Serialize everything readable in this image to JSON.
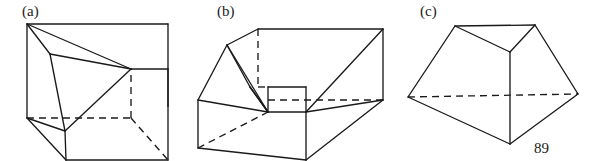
{
  "document": {
    "kind": "textbook-figure-plate",
    "page_number": "89",
    "background_color": "#ffffff",
    "ink_color": "#1a1a1a"
  },
  "figures": [
    {
      "id": "figure-a",
      "label": "(a)",
      "label_position": {
        "x": 22,
        "y": 16
      },
      "description": "cube in oblique projection with an inscribed triangular (tetrahedral) cut",
      "solid_edges": [
        "M27,24 L27,118",
        "M27,24 L131,69",
        "M27,24 L168,24",
        "M168,24 L168,106",
        "M131,69 L168,69",
        "M168,69 L168,106",
        "M27,118 L66,160",
        "M66,160 L168,160",
        "M168,160 L168,106",
        "M27,24 L50,54",
        "M50,54 L131,69",
        "M50,54 L65,131",
        "M65,131 L131,69",
        "M65,131 L66,160",
        "M27,118 L65,131"
      ],
      "hidden_edges": [
        "M27,118 L131,118",
        "M131,118 L131,69",
        "M131,118 L168,160"
      ]
    },
    {
      "id": "figure-b",
      "label": "(b)",
      "label_position": {
        "x": 217,
        "y": 16
      },
      "description": "rectangular box with a sloping wedge cut at the left-hand end",
      "solid_edges": [
        "M258,29 L383,29",
        "M383,29 L383,100",
        "M258,29 L227,45",
        "M227,45 L198,100",
        "M198,100 L198,148",
        "M198,148 L306,160",
        "M306,160 L306,112",
        "M306,112 L383,100",
        "M306,160 L383,100",
        "M227,45 L250,87",
        "M250,87 L268,112",
        "M268,112 L306,112",
        "M268,112 L250,87",
        "M227,45 L268,112",
        "M198,100 L268,112",
        "M306,112 L383,29",
        "M268,112 L268,87",
        "M268,87 L306,87",
        "M306,87 L306,112"
      ],
      "hidden_edges": [
        "M258,29 L258,87",
        "M258,87 L268,87",
        "M268,100 L383,100",
        "M198,148 L268,112"
      ]
    },
    {
      "id": "figure-c",
      "label": "(c)",
      "label_position": {
        "x": 420,
        "y": 16
      },
      "description": "truncated prism-like solid with three visible faces meeting at a central vertex",
      "solid_edges": [
        "M455,26 L535,25",
        "M455,26 L510,52",
        "M535,25 L510,52",
        "M510,52 L510,144",
        "M455,26 L408,97",
        "M408,97 L510,144",
        "M535,25 L578,94",
        "M578,94 L510,144"
      ],
      "hidden_edges": [
        "M408,97 L578,94"
      ]
    }
  ],
  "page_number_position": {
    "x": 534,
    "y": 153
  }
}
